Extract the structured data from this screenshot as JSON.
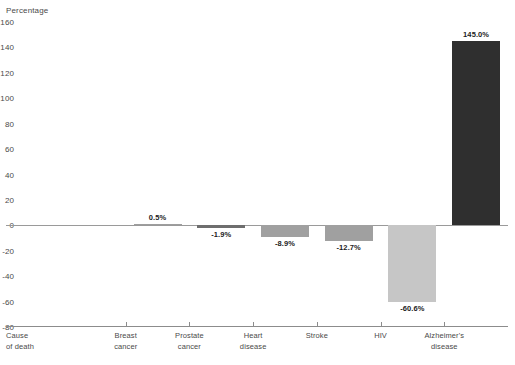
{
  "chart_data": {
    "type": "bar",
    "title": "",
    "subtitle": "",
    "xlabel": "",
    "ylabel": "Percentage",
    "ylim": [
      -80,
      160
    ],
    "ytick_step": 20,
    "grid": false,
    "legend": "none",
    "zero_reference_line": true,
    "categories": [
      "Cause\nof death",
      "Breast\ncancer",
      "Prostate\ncancer",
      "Heart\ndisease",
      "Stroke",
      "HIV",
      "Alzheimer's\ndisease"
    ],
    "values": [
      null,
      0.5,
      -1.9,
      -8.9,
      -12.7,
      -60.6,
      145.0
    ],
    "data_labels": [
      "",
      "0.5%",
      "-1.9%",
      "-8.9%",
      "-12.7%",
      "-60.6%",
      "145.0%"
    ],
    "bar_colors": [
      "#ffffff",
      "#9e9e9e",
      "#6e6e6e",
      "#a0a0a0",
      "#a0a0a0",
      "#c6c6c6",
      "#2f2f2f"
    ],
    "ytick_labels": [
      "160",
      "140",
      "120",
      "100",
      "80",
      "60",
      "40",
      "20",
      "0",
      "-20",
      "-40",
      "-60",
      "-80"
    ],
    "ytick_values": [
      160,
      140,
      120,
      100,
      80,
      60,
      40,
      20,
      0,
      -20,
      -40,
      -60,
      -80
    ]
  },
  "axis": {
    "y_title": "Percentage"
  },
  "colors": {
    "axis_line": "#8c8c8c",
    "zero_line": "#9a9a9a",
    "text": "#4a4a4a",
    "label_text": "#1c1c1c",
    "background": "#ffffff"
  }
}
